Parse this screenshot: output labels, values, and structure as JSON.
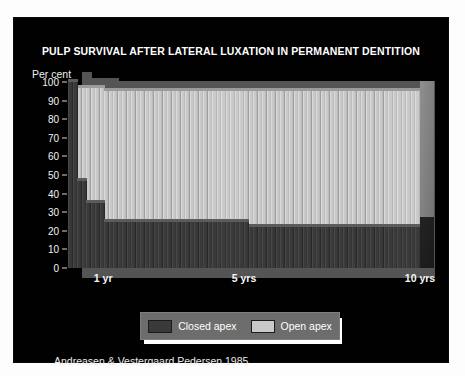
{
  "slide": {
    "background": "#ffffff",
    "board_background": "#010101"
  },
  "title": "PULP SURVIVAL AFTER LATERAL LUXATION IN PERMANENT DENTITION",
  "credit": "Andreasen & Vestergaard Pedersen 1985",
  "legend": {
    "items": [
      {
        "label": "Closed apex",
        "color": "#3a3a3a"
      },
      {
        "label": "Open apex",
        "color": "#c9c9c9"
      }
    ]
  },
  "chart_data": {
    "type": "area",
    "title": "PULP SURVIVAL AFTER LATERAL LUXATION IN PERMANENT DENTITION",
    "subtitle": "",
    "xlabel": "",
    "ylabel": "Per cent",
    "ylim": [
      0,
      100
    ],
    "yticks": [
      100,
      90,
      80,
      70,
      60,
      50,
      40,
      30,
      20,
      10,
      0
    ],
    "xlim": [
      0,
      10
    ],
    "xticks": [
      1,
      5,
      10
    ],
    "xtick_labels": [
      "1 yr",
      "5 yrs",
      "10 yrs"
    ],
    "grid": false,
    "legend_position": "below-center",
    "annotation": "Andreasen & Vestergaard Pedersen 1985",
    "x_unit": "years",
    "series": [
      {
        "name": "Closed apex",
        "color": "#3a3a3a",
        "cap_color": "#585858",
        "step_points": [
          {
            "x": 0.0,
            "y": 100
          },
          {
            "x": 0.22,
            "y": 47
          },
          {
            "x": 0.52,
            "y": 35
          },
          {
            "x": 1.0,
            "y": 25
          },
          {
            "x": 5.1,
            "y": 22
          },
          {
            "x": 10.0,
            "y": 22
          }
        ]
      },
      {
        "name": "Open apex",
        "color": "#c9c9c9",
        "cap_color": "#9b9b9b",
        "step_points": [
          {
            "x": 0.0,
            "y": 100
          },
          {
            "x": 0.25,
            "y": 97
          },
          {
            "x": 1.0,
            "y": 95
          },
          {
            "x": 5.1,
            "y": 95
          },
          {
            "x": 10.0,
            "y": 95
          }
        ]
      }
    ]
  }
}
